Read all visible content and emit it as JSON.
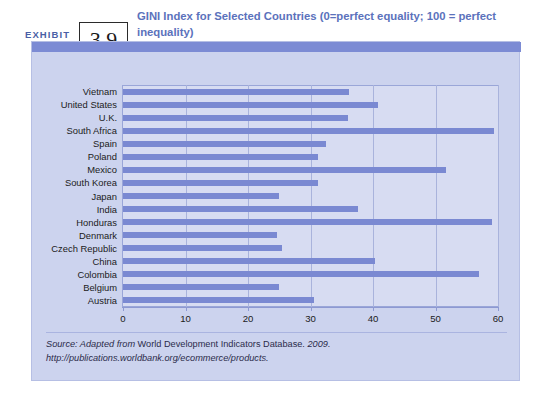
{
  "exhibit": {
    "label": "EXHIBIT",
    "number": "3.9",
    "title": "GINI Index for Selected Countries (0=perfect equality; 100 = perfect inequality)"
  },
  "source": {
    "prefix": "Source: Adapted from",
    "database": "World Development Indicators Database.",
    "year": "2009.",
    "url": "http://publications.worldbank.org/ecommerce/products."
  },
  "colors": {
    "bar": "#7a89d2",
    "panel": "#ccd3ee",
    "plot": "#d7dcf2",
    "topbar": "#7c8bd4",
    "title": "#5b72bc",
    "grid": "#a9b3dc"
  },
  "chart_data": {
    "type": "bar",
    "orientation": "horizontal",
    "title": "GINI Index for Selected Countries (0=perfect equality; 100 = perfect inequality)",
    "xlabel": "",
    "ylabel": "",
    "xlim": [
      0,
      60
    ],
    "xticks": [
      0,
      10,
      20,
      30,
      40,
      50,
      60
    ],
    "grid": true,
    "legend": "none",
    "categories": [
      "Vietnam",
      "United States",
      "U.K.",
      "South Africa",
      "Spain",
      "Poland",
      "Mexico",
      "South Korea",
      "Japan",
      "India",
      "Honduras",
      "Denmark",
      "Czech Republic",
      "China",
      "Colombia",
      "Belgium",
      "Austria"
    ],
    "values": [
      36.1,
      40.8,
      36.0,
      59.3,
      32.5,
      31.2,
      51.6,
      31.2,
      24.9,
      37.6,
      59.0,
      24.7,
      25.4,
      40.3,
      57.0,
      25.0,
      30.5
    ]
  }
}
